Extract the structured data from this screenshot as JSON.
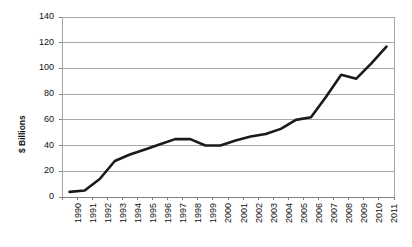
{
  "chart_data": {
    "type": "line",
    "title": "",
    "xlabel": "",
    "ylabel": "$ Billions",
    "x": [
      1990,
      1991,
      1992,
      1993,
      1994,
      1995,
      1996,
      1997,
      1998,
      1999,
      2000,
      2001,
      2002,
      2003,
      2004,
      2005,
      2006,
      2007,
      2008,
      2009,
      2010,
      2011
    ],
    "categories": [
      "1990",
      "1991",
      "1992",
      "1993",
      "1994",
      "1995",
      "1996",
      "1997",
      "1998",
      "1999",
      "2000",
      "2001",
      "2002",
      "2003",
      "2004",
      "2005",
      "2006",
      "2007",
      "2008",
      "2009",
      "2010",
      "2011"
    ],
    "values": [
      4,
      5,
      14,
      28,
      33,
      37,
      41,
      45,
      45,
      40,
      40,
      44,
      47,
      49,
      53,
      60,
      62,
      78,
      95,
      92,
      104,
      117
    ],
    "ylim": [
      0,
      140
    ],
    "yticks": [
      0,
      20,
      40,
      60,
      80,
      100,
      120,
      140
    ],
    "ytick_labels": [
      "0",
      "20",
      "40",
      "60",
      "80",
      "100",
      "120",
      "140"
    ],
    "grid": true,
    "legend": false,
    "legend_position": "none",
    "line_color": "#1a1a1a",
    "grid_color": "#a6a6a6",
    "axis_color": "#808080",
    "background": "#ffffff"
  }
}
